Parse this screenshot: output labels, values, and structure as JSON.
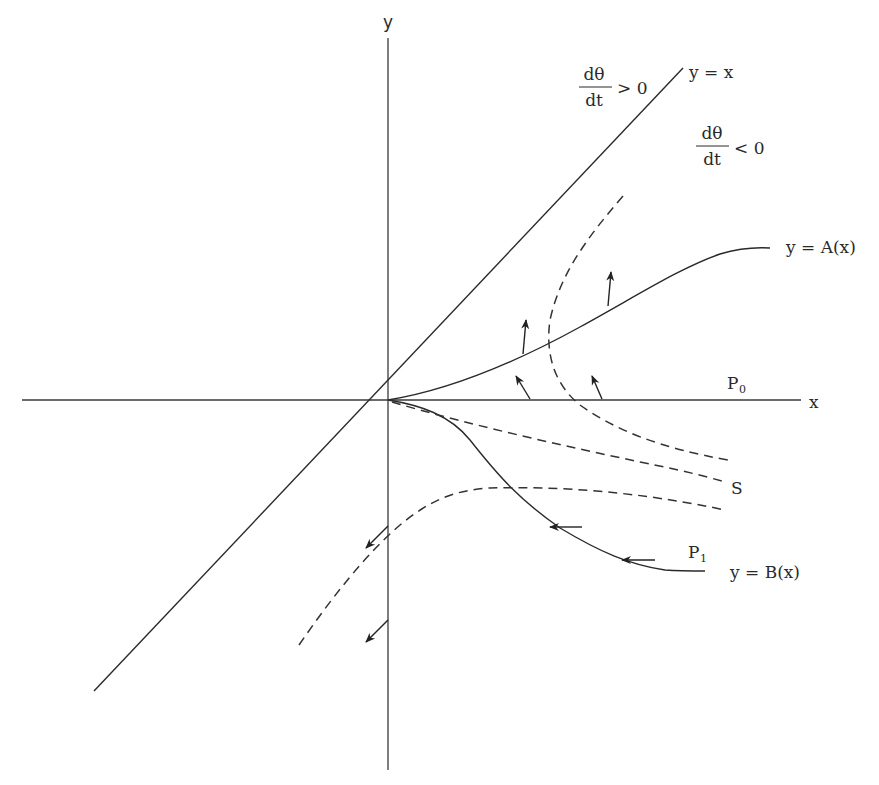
{
  "diagram": {
    "type": "phase-plane",
    "axes": {
      "x_label": "x",
      "y_label": "y"
    },
    "lines": {
      "diagonal_label": "y = x",
      "upper_curve_label": "y = A(x)",
      "lower_curve_label": "y = B(x)",
      "separatrix_label": "S"
    },
    "regions": {
      "above_diagonal": {
        "numerator": "dθ",
        "denominator": "dt",
        "relation": "> 0"
      },
      "below_diagonal": {
        "numerator": "dθ",
        "denominator": "dt",
        "relation": "< 0"
      }
    },
    "points": {
      "p0": {
        "main": "P",
        "sub": "0"
      },
      "p1": {
        "main": "P",
        "sub": "1"
      }
    },
    "colors": {
      "ink": "#2a2a2a",
      "background": "#ffffff"
    }
  }
}
